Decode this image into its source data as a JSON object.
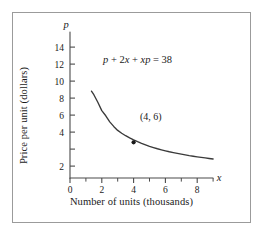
{
  "chart_data": {
    "type": "line",
    "title": "",
    "subtitle": "",
    "xlabel": "Number of units (thousands)",
    "ylabel": "Price per unit (dollars)",
    "x_axis_variable": "x",
    "y_axis_variable": "p",
    "xlim": [
      0,
      9.6
    ],
    "ylim": [
      0,
      15.6
    ],
    "grid": false,
    "legend": "none",
    "equation_annotation": "p + 2x + xp = 38",
    "equation_parts": {
      "p": "p",
      "plus1": " + ",
      "two": "2",
      "x1": "x",
      "plus2": " + ",
      "x2": "x",
      "p2": "p",
      "equals": " = ",
      "value": "38"
    },
    "xticks_major": [
      0,
      2,
      4,
      6,
      8
    ],
    "xticks_major_labels": [
      "0",
      "2",
      "4",
      "6",
      "8"
    ],
    "xticks_minor": [
      1,
      3,
      5,
      7,
      9
    ],
    "yticks_major": [
      2,
      4,
      6,
      8,
      10,
      12,
      14
    ],
    "yticks_major_labels": [
      "2",
      "4",
      "6",
      "8",
      "10",
      "12",
      "14"
    ],
    "series": [
      {
        "name": "demand curve",
        "relation": "p = (38 - 2x) / (1 + x)",
        "x": [
          1.35,
          1.5,
          1.75,
          2.0,
          2.25,
          2.5,
          2.75,
          3.0,
          3.25,
          3.5,
          3.75,
          4.0,
          4.25,
          4.5,
          4.75,
          5.0,
          5.25,
          5.5,
          5.75,
          6.0,
          6.25,
          6.5,
          6.75,
          7.0,
          7.25,
          7.5,
          7.75,
          8.0,
          8.25,
          8.5,
          8.75,
          9.0
        ],
        "y": [
          14.6,
          14.0,
          12.73,
          11.33,
          10.46,
          9.43,
          8.67,
          8.0,
          7.53,
          7.11,
          6.74,
          6.4,
          6.1,
          5.82,
          5.57,
          5.33,
          5.12,
          4.92,
          4.74,
          4.57,
          4.41,
          4.27,
          4.13,
          4.0,
          3.88,
          3.76,
          3.66,
          3.56,
          3.46,
          3.37,
          3.28,
          3.2
        ],
        "color": "#3a3a3a"
      }
    ],
    "annotated_points": [
      {
        "label": "(4, 6)",
        "x": 4,
        "y": 6,
        "marker": "dot",
        "color": "#1a1a1a"
      }
    ],
    "colors": {
      "curve": "#3a3a3a",
      "axis": "#4a4a4a",
      "text": "#1a1a1a",
      "frame": "#9b9b9b",
      "background": "#ffffff"
    }
  }
}
